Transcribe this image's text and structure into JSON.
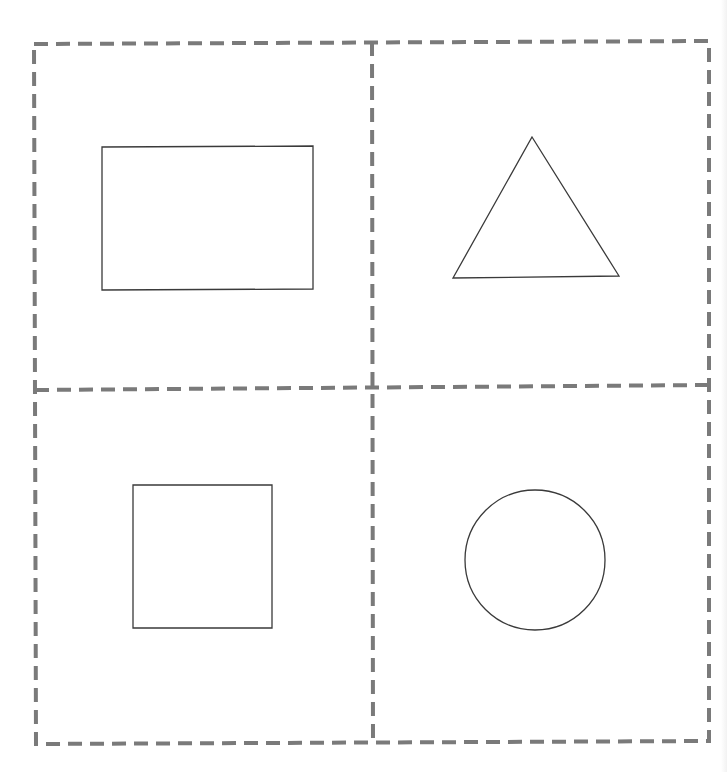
{
  "page": {
    "background": "#ffffff",
    "width": 727,
    "height": 772
  },
  "grid": {
    "line_color": "#7a7a7a",
    "line_width": 4,
    "dash_pattern": "14,8",
    "outer_corners": {
      "top_left": [
        34,
        44
      ],
      "top_right": [
        709,
        41
      ],
      "bottom_right": [
        709,
        741
      ],
      "bottom_left": [
        36,
        744
      ]
    },
    "vertical_divider": {
      "top": [
        372,
        42
      ],
      "bottom": [
        373,
        743
      ]
    },
    "horizontal_divider": {
      "left": [
        35,
        390
      ],
      "right": [
        709,
        385
      ]
    },
    "cells": [
      {
        "position": "top-left",
        "shape": "rectangle"
      },
      {
        "position": "top-right",
        "shape": "triangle"
      },
      {
        "position": "bottom-left",
        "shape": "square"
      },
      {
        "position": "bottom-right",
        "shape": "circle"
      }
    ]
  },
  "shapes": {
    "stroke_color": "#3a3a3a",
    "stroke_width": 1.3,
    "fill": "none",
    "rectangle": {
      "points": "102,147 313,146 313,289 102,290"
    },
    "triangle": {
      "points": "532,137 619,276 453,278"
    },
    "square": {
      "points": "133,485 272,485 272,628 133,628"
    },
    "circle": {
      "cx": 535,
      "cy": 560,
      "r": 70
    }
  }
}
